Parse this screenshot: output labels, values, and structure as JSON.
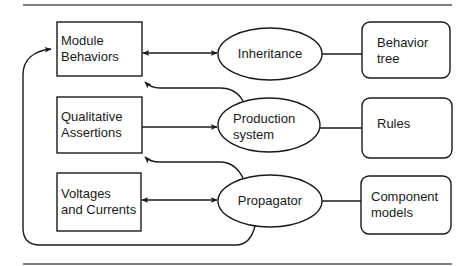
{
  "diagram": {
    "left_boxes": [
      {
        "id": "module-behaviors",
        "label": "Module\nBehaviors"
      },
      {
        "id": "qualitative-assertions",
        "label": "Qualitative\nAssertions"
      },
      {
        "id": "voltages-and-currents",
        "label": "Voltages\nand Currents"
      }
    ],
    "ellipses": [
      {
        "id": "inheritance",
        "label": "Inheritance"
      },
      {
        "id": "production-system",
        "label": "Production\nsystem"
      },
      {
        "id": "propagator",
        "label": "Propagator"
      }
    ],
    "right_boxes": [
      {
        "id": "behavior-tree",
        "label": "Behavior\ntree"
      },
      {
        "id": "rules",
        "label": "Rules"
      },
      {
        "id": "component-models",
        "label": "Component\nmodels"
      }
    ],
    "edges": [
      {
        "from": "module-behaviors",
        "to": "inheritance",
        "type": "bidirectional"
      },
      {
        "from": "qualitative-assertions",
        "to": "production-system",
        "type": "directed"
      },
      {
        "from": "voltages-and-currents",
        "to": "propagator",
        "type": "bidirectional"
      },
      {
        "from": "inheritance",
        "to": "behavior-tree",
        "type": "line"
      },
      {
        "from": "production-system",
        "to": "rules",
        "type": "line"
      },
      {
        "from": "propagator",
        "to": "component-models",
        "type": "line"
      },
      {
        "from": "production-system",
        "to": "module-behaviors",
        "type": "directed"
      },
      {
        "from": "propagator",
        "to": "qualitative-assertions",
        "type": "directed"
      },
      {
        "from": "propagator",
        "to": "module-behaviors",
        "type": "directed-loop"
      }
    ],
    "stroke_color": "#1a1a1a",
    "rule_color": "#555555"
  }
}
